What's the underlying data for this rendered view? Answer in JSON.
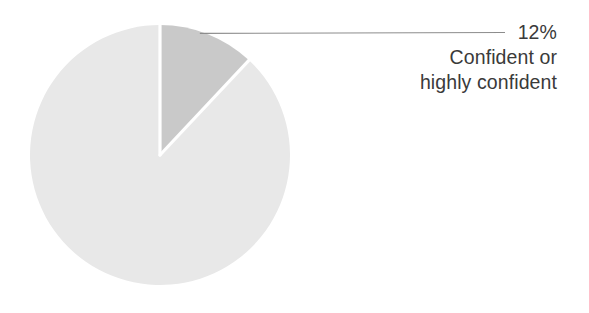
{
  "chart_data": {
    "type": "pie",
    "title": "",
    "subtitle": "",
    "xlabel": "",
    "ylabel": "",
    "legend_position": "none",
    "grid": false,
    "units": "percent",
    "start_angle_deg": 0,
    "direction": "clockwise",
    "categories": [
      "Confident or highly confident",
      "Not confident"
    ],
    "values": [
      12,
      88
    ],
    "slices": [
      {
        "label": "Confident or highly confident",
        "value": 12,
        "value_text": "12%",
        "color": "#c9c9c9",
        "labeled": true,
        "callout_lines": [
          "12%",
          "Confident or",
          "highly confident"
        ]
      },
      {
        "label": "",
        "value": 88,
        "value_text": "",
        "color": "#e8e8e8",
        "labeled": false,
        "callout_lines": []
      }
    ],
    "annotations": [
      {
        "name": "leader-line",
        "from_slice": "Confident or highly confident",
        "text": "12% Confident or highly confident"
      }
    ]
  },
  "callout": {
    "percent": "12%",
    "line2": "Confident or",
    "line3": "highly confident"
  },
  "colors": {
    "background": "#ffffff",
    "slice_highlight": "#c9c9c9",
    "slice_remainder": "#e8e8e8",
    "separator": "#ffffff",
    "leader_line": "#8c8c8c",
    "text": "#3a3a3a"
  },
  "geometry": {
    "center_x": 160,
    "center_y": 155,
    "radius": 130
  }
}
